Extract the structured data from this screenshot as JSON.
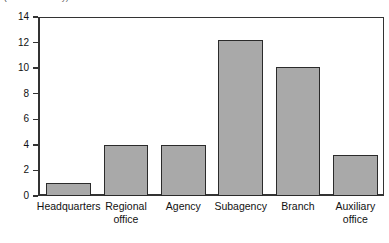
{
  "chart_data": {
    "type": "bar",
    "title": "(number of entity)",
    "xlabel": "",
    "ylabel": "",
    "categories": [
      "Headquarters",
      "Regional office",
      "Agency",
      "Subagency",
      "Branch",
      "Auxiliary office"
    ],
    "category_lines": [
      [
        "Headquarters"
      ],
      [
        "Regional",
        "office"
      ],
      [
        "Agency"
      ],
      [
        "Subagency"
      ],
      [
        "Branch"
      ],
      [
        "Auxiliary",
        "office"
      ]
    ],
    "values": [
      1.0,
      4.0,
      4.0,
      12.2,
      10.1,
      3.2
    ],
    "ylim": [
      0,
      14
    ],
    "yticks": [
      0,
      2,
      4,
      6,
      8,
      10,
      12,
      14
    ],
    "ytick_labels": [
      "0",
      "2",
      "4",
      "6",
      "8",
      "10",
      "12",
      "14"
    ],
    "grid": false,
    "legend": null,
    "colors": {
      "bar_fill": "#a9a9a9",
      "bar_border": "#2b2b2b",
      "axis": "#333333",
      "text": "#111111",
      "background": "#ffffff"
    }
  }
}
